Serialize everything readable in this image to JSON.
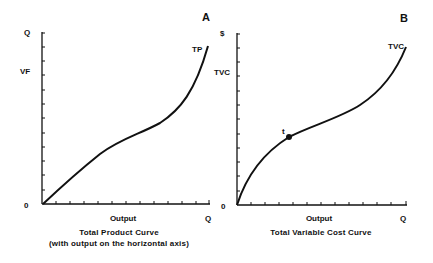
{
  "panels": [
    {
      "id": "A",
      "panel_label": "A",
      "y_axis_top_label": "Q",
      "y_axis_mid_label": "VF",
      "origin_label": "0",
      "x_axis_label": "Output",
      "x_axis_end_label": "Q",
      "curve_label": "TP",
      "caption_line1": "Total Product Curve",
      "caption_line2": "(with output on the horizontal axis)"
    },
    {
      "id": "B",
      "panel_label": "B",
      "y_axis_top_label": "$",
      "y_axis_mid_label": "TVC",
      "origin_label": "0",
      "x_axis_label": "Output",
      "x_axis_end_label": "Q",
      "curve_label": "TVC",
      "point_label": "t",
      "caption_line1": "Total Variable Cost Curve"
    }
  ],
  "colors": {
    "ink": "#111111",
    "background": "#ffffff"
  }
}
